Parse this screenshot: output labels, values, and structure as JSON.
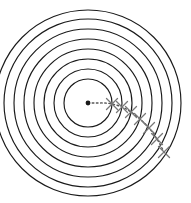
{
  "figure": {
    "kind": "concentric-circles-diagram",
    "width": 203,
    "height": 203,
    "background_color": "#ffffff",
    "caption": ""
  },
  "chart_data": {
    "type": "scatter",
    "title": "",
    "subtitle": "",
    "xlabel": "",
    "ylabel": "",
    "grid": false,
    "legend_position": "none",
    "axis_visible": false,
    "tick_labels": [],
    "annotations": [],
    "center": {
      "x": 88,
      "y": 103,
      "label": ""
    },
    "ring_color": "#1a1a1a",
    "ring_stroke_width": 1.15,
    "ring_count": 8,
    "ring_radii": [
      24,
      34,
      44,
      54,
      64,
      74,
      84,
      93
    ],
    "path_color": "#555555",
    "path_style": "dotted",
    "marker_symbol": "x",
    "marker_color": "#777777",
    "path_points": [
      {
        "x": 88,
        "y": 103
      },
      {
        "x": 96,
        "y": 103
      },
      {
        "x": 104,
        "y": 103
      },
      {
        "x": 112,
        "y": 104
      },
      {
        "x": 122,
        "y": 107
      },
      {
        "x": 131,
        "y": 112
      },
      {
        "x": 140,
        "y": 119
      },
      {
        "x": 149,
        "y": 128
      },
      {
        "x": 157,
        "y": 139
      },
      {
        "x": 164,
        "y": 152
      }
    ],
    "markers": [
      {
        "x": 112,
        "y": 104
      },
      {
        "x": 122,
        "y": 107
      },
      {
        "x": 131,
        "y": 112
      },
      {
        "x": 140,
        "y": 119
      },
      {
        "x": 149,
        "y": 128
      },
      {
        "x": 157,
        "y": 139
      },
      {
        "x": 164,
        "y": 152
      }
    ],
    "marker_size": 5.5
  }
}
